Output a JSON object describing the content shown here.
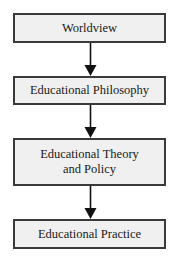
{
  "diagram": {
    "type": "flowchart",
    "direction": "top-to-bottom",
    "nodes": [
      {
        "id": "worldview",
        "label": "Worldview"
      },
      {
        "id": "educational-philosophy",
        "label": "Educational Philosophy"
      },
      {
        "id": "educational-theory-policy",
        "label": "Educational Theory\nand Policy"
      },
      {
        "id": "educational-practice",
        "label": "Educational Practice"
      }
    ],
    "edges": [
      {
        "from": "worldview",
        "to": "educational-philosophy"
      },
      {
        "from": "educational-philosophy",
        "to": "educational-theory-policy"
      },
      {
        "from": "educational-theory-policy",
        "to": "educational-practice"
      }
    ],
    "colors": {
      "box_fill": "#f0f0f0",
      "box_border": "#3a3a3a",
      "arrow": "#111111",
      "text": "#1a1a1a"
    }
  }
}
